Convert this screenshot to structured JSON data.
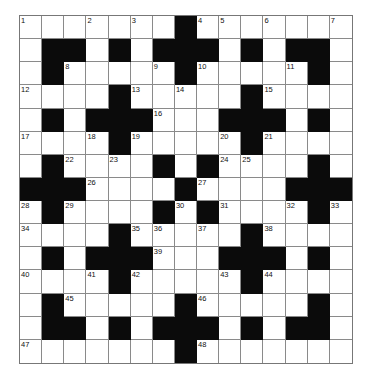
{
  "puzzle": {
    "type": "crossword",
    "size": {
      "rows": 15,
      "cols": 15
    },
    "colors": {
      "block": "#0b0b0b",
      "cell": "#ffffff",
      "line": "#8a8a8a"
    },
    "pattern": [
      "WWWWWWWBWWWWWWW",
      "WBBWBWBBBWBWBBW",
      "WBWWWWWBWWWWWBW",
      "WWWWBWWWWWBWWWW",
      "WBWBBBWWWBBBWBW",
      "WWWWBWWWWWBWWWW",
      "WBWWWWBWBWWWWBW",
      "BBBWWWWBWWWWBBB",
      "WBWWWWBWBWWWWBW",
      "WWWWBWWWWWBWWWW",
      "WBWBBBWWWBBBWBW",
      "WWWWBWWWWWBWWWW",
      "WBWWWWWBWWWWWBW",
      "WBBWBWBBBWBWBBW",
      "WWWWWWWBWWWWWWW"
    ],
    "numbers": [
      {
        "r": 0,
        "c": 0,
        "n": "1"
      },
      {
        "r": 0,
        "c": 3,
        "n": "2"
      },
      {
        "r": 0,
        "c": 5,
        "n": "3"
      },
      {
        "r": 0,
        "c": 8,
        "n": "4"
      },
      {
        "r": 0,
        "c": 9,
        "n": "5"
      },
      {
        "r": 0,
        "c": 11,
        "n": "6"
      },
      {
        "r": 0,
        "c": 14,
        "n": "7"
      },
      {
        "r": 2,
        "c": 2,
        "n": "8"
      },
      {
        "r": 2,
        "c": 6,
        "n": "9"
      },
      {
        "r": 2,
        "c": 8,
        "n": "10"
      },
      {
        "r": 2,
        "c": 12,
        "n": "11"
      },
      {
        "r": 3,
        "c": 0,
        "n": "12"
      },
      {
        "r": 3,
        "c": 5,
        "n": "13"
      },
      {
        "r": 3,
        "c": 7,
        "n": "14"
      },
      {
        "r": 3,
        "c": 11,
        "n": "15"
      },
      {
        "r": 4,
        "c": 6,
        "n": "16"
      },
      {
        "r": 5,
        "c": 0,
        "n": "17"
      },
      {
        "r": 5,
        "c": 3,
        "n": "18"
      },
      {
        "r": 5,
        "c": 5,
        "n": "19"
      },
      {
        "r": 5,
        "c": 9,
        "n": "20"
      },
      {
        "r": 5,
        "c": 11,
        "n": "21"
      },
      {
        "r": 6,
        "c": 2,
        "n": "22"
      },
      {
        "r": 6,
        "c": 4,
        "n": "23"
      },
      {
        "r": 6,
        "c": 9,
        "n": "24"
      },
      {
        "r": 6,
        "c": 10,
        "n": "25"
      },
      {
        "r": 7,
        "c": 3,
        "n": "26"
      },
      {
        "r": 7,
        "c": 8,
        "n": "27"
      },
      {
        "r": 8,
        "c": 0,
        "n": "28"
      },
      {
        "r": 8,
        "c": 2,
        "n": "29"
      },
      {
        "r": 8,
        "c": 7,
        "n": "30"
      },
      {
        "r": 8,
        "c": 9,
        "n": "31"
      },
      {
        "r": 8,
        "c": 12,
        "n": "32"
      },
      {
        "r": 8,
        "c": 14,
        "n": "33"
      },
      {
        "r": 9,
        "c": 0,
        "n": "34"
      },
      {
        "r": 9,
        "c": 5,
        "n": "35"
      },
      {
        "r": 9,
        "c": 6,
        "n": "36"
      },
      {
        "r": 9,
        "c": 8,
        "n": "37"
      },
      {
        "r": 9,
        "c": 11,
        "n": "38"
      },
      {
        "r": 10,
        "c": 6,
        "n": "39"
      },
      {
        "r": 11,
        "c": 0,
        "n": "40"
      },
      {
        "r": 11,
        "c": 3,
        "n": "41"
      },
      {
        "r": 11,
        "c": 5,
        "n": "42"
      },
      {
        "r": 11,
        "c": 9,
        "n": "43"
      },
      {
        "r": 11,
        "c": 11,
        "n": "44"
      },
      {
        "r": 12,
        "c": 2,
        "n": "45"
      },
      {
        "r": 12,
        "c": 8,
        "n": "46"
      },
      {
        "r": 14,
        "c": 0,
        "n": "47"
      },
      {
        "r": 14,
        "c": 8,
        "n": "48"
      }
    ]
  }
}
